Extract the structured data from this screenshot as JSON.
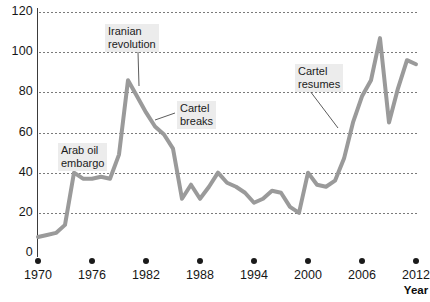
{
  "title_sliver": "",
  "axes": {
    "y_ticks": [
      0,
      20,
      40,
      60,
      80,
      100,
      120
    ],
    "y_min": 0,
    "y_max": 120,
    "x_ticks": [
      1970,
      1976,
      1982,
      1988,
      1994,
      2000,
      2006,
      2012
    ],
    "x_min": 1970,
    "x_max": 2012,
    "x_axis_title": "Year",
    "tick_marker": "filled-circle"
  },
  "annotations": [
    {
      "id": "arab-oil-embargo",
      "line1": "Arab oil",
      "line2": "embargo",
      "x": 58,
      "y": 143,
      "leader": null
    },
    {
      "id": "iranian-revolution",
      "line1": "Iranian",
      "line2": "revolution",
      "x": 105,
      "y": 24,
      "leader": {
        "x1": 138,
        "y1": 52,
        "x2": 139,
        "y2": 86
      }
    },
    {
      "id": "cartel-breaks",
      "line1": "Cartel",
      "line2": "breaks",
      "x": 177,
      "y": 101,
      "leader": {
        "x1": 175,
        "y1": 113,
        "x2": 155,
        "y2": 120
      }
    },
    {
      "id": "cartel-resumes",
      "line1": "Cartel",
      "line2": "resumes",
      "x": 295,
      "y": 64,
      "leader": {
        "x1": 310,
        "y1": 91,
        "x2": 338,
        "y2": 128
      }
    }
  ],
  "series_style": {
    "color": "#9a9a9a",
    "width": 4
  },
  "chart_data": {
    "type": "line",
    "title": "",
    "subtitle": "",
    "xlabel": "Year",
    "ylabel": "",
    "xlim": [
      1970,
      2012
    ],
    "ylim": [
      0,
      120
    ],
    "grid": "horizontal-dotted",
    "legend": "none",
    "x": [
      1970,
      1971,
      1972,
      1973,
      1974,
      1975,
      1976,
      1977,
      1978,
      1979,
      1980,
      1981,
      1982,
      1983,
      1984,
      1985,
      1986,
      1987,
      1988,
      1989,
      1990,
      1991,
      1992,
      1993,
      1994,
      1995,
      1996,
      1997,
      1998,
      1999,
      2000,
      2001,
      2002,
      2003,
      2004,
      2005,
      2006,
      2007,
      2008,
      2009,
      2010,
      2011,
      2012
    ],
    "values": [
      8,
      9,
      10,
      14,
      40,
      37,
      37,
      38,
      37,
      49,
      86,
      78,
      70,
      63,
      59,
      52,
      27,
      34,
      27,
      33,
      40,
      35,
      33,
      30,
      25,
      27,
      31,
      30,
      23,
      20,
      40,
      34,
      33,
      36,
      47,
      65,
      78,
      86,
      107,
      65,
      82,
      96,
      94
    ],
    "series": [
      {
        "name": "Crude oil price (US dollars per barrel)",
        "values": [
          8,
          9,
          10,
          14,
          40,
          37,
          37,
          38,
          37,
          49,
          86,
          78,
          70,
          63,
          59,
          52,
          27,
          34,
          27,
          33,
          40,
          35,
          33,
          30,
          25,
          27,
          31,
          30,
          23,
          20,
          40,
          34,
          33,
          36,
          47,
          65,
          78,
          86,
          107,
          65,
          82,
          96,
          94
        ]
      }
    ],
    "annotations": [
      {
        "label": "Arab oil embargo",
        "x": 1974
      },
      {
        "label": "Iranian revolution",
        "x": 1980
      },
      {
        "label": "Cartel breaks",
        "x": 1986
      },
      {
        "label": "Cartel resumes",
        "x": 2004
      }
    ]
  }
}
